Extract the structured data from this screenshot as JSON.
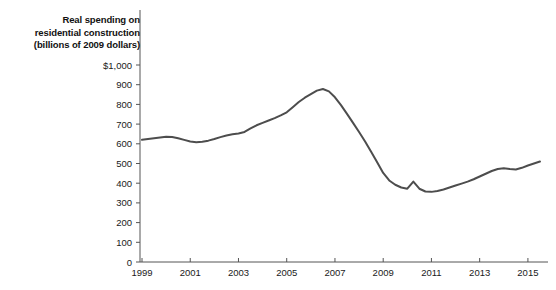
{
  "chart_data": {
    "type": "line",
    "title": "Real spending on residential construction (billions of 2009 dollars)",
    "title_lines": [
      "Real spending on",
      "residential construction",
      "(billions of 2009 dollars)"
    ],
    "xlabel": "",
    "ylabel": "",
    "ylim": [
      0,
      1000
    ],
    "xlim": [
      1999,
      2015.75
    ],
    "grid": false,
    "legend": false,
    "line_color": "#4d4d4d",
    "axis_color": "#555555",
    "background_color": "#ffffff",
    "y_ticks": [
      0,
      100,
      200,
      300,
      400,
      500,
      600,
      700,
      800,
      900,
      1000
    ],
    "y_tick_labels": [
      "0",
      "100",
      "200",
      "300",
      "400",
      "500",
      "600",
      "700",
      "800",
      "900",
      "$1,000"
    ],
    "x_ticks": [
      1999,
      2001,
      2003,
      2005,
      2007,
      2009,
      2011,
      2013,
      2015
    ],
    "x_tick_labels": [
      "1999",
      "2001",
      "2003",
      "2005",
      "2007",
      "2009",
      "2011",
      "2013",
      "2015"
    ],
    "series": [
      {
        "name": "Real spending on residential construction",
        "x": [
          1999.0,
          1999.25,
          1999.5,
          1999.75,
          2000.0,
          2000.25,
          2000.5,
          2000.75,
          2001.0,
          2001.25,
          2001.5,
          2001.75,
          2002.0,
          2002.25,
          2002.5,
          2002.75,
          2003.0,
          2003.25,
          2003.5,
          2003.75,
          2004.0,
          2004.25,
          2004.5,
          2004.75,
          2005.0,
          2005.25,
          2005.5,
          2005.75,
          2006.0,
          2006.25,
          2006.5,
          2006.75,
          2007.0,
          2007.25,
          2007.5,
          2007.75,
          2008.0,
          2008.25,
          2008.5,
          2008.75,
          2009.0,
          2009.25,
          2009.5,
          2009.75,
          2010.0,
          2010.25,
          2010.5,
          2010.75,
          2011.0,
          2011.25,
          2011.5,
          2011.75,
          2012.0,
          2012.25,
          2012.5,
          2012.75,
          2013.0,
          2013.25,
          2013.5,
          2013.75,
          2014.0,
          2014.25,
          2014.5,
          2014.75,
          2015.0,
          2015.25,
          2015.5
        ],
        "values": [
          620,
          624,
          628,
          632,
          636,
          634,
          628,
          620,
          612,
          608,
          610,
          616,
          624,
          634,
          642,
          648,
          652,
          660,
          678,
          694,
          706,
          718,
          730,
          744,
          760,
          786,
          812,
          834,
          852,
          870,
          878,
          866,
          836,
          796,
          752,
          706,
          660,
          612,
          560,
          506,
          452,
          414,
          392,
          378,
          372,
          408,
          372,
          358,
          356,
          360,
          368,
          378,
          388,
          398,
          408,
          420,
          434,
          448,
          462,
          472,
          476,
          472,
          470,
          478,
          490,
          500,
          510
        ]
      }
    ]
  }
}
